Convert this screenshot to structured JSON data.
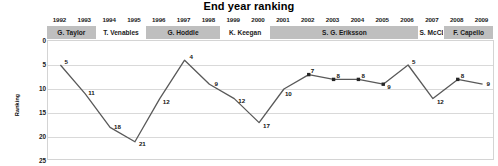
{
  "chart_data": {
    "type": "line",
    "title": "End year ranking",
    "xlabel": "",
    "ylabel": "Ranking",
    "ylim": [
      0,
      25
    ],
    "y_inverted": true,
    "y_ticks": [
      0,
      5,
      10,
      15,
      20,
      25
    ],
    "grid": true,
    "legend": "none",
    "x": [
      "1992",
      "1993",
      "1994",
      "1995",
      "1996",
      "1997",
      "1998",
      "1999",
      "2000",
      "2001",
      "2002",
      "2003",
      "2004",
      "2005",
      "2006",
      "2007",
      "2008",
      "2009"
    ],
    "categories": [
      "1992",
      "1993",
      "1994",
      "1995",
      "1996",
      "1997",
      "1998",
      "1999",
      "2000",
      "2001",
      "2002",
      "2003",
      "2004",
      "2005",
      "2006",
      "2007",
      "2008",
      "2009"
    ],
    "values": [
      5,
      11,
      18,
      21,
      12,
      4,
      9,
      12,
      17,
      10,
      7,
      8,
      8,
      9,
      5,
      12,
      8,
      9
    ],
    "data_labels": [
      "5",
      "11",
      "18",
      "21",
      "12",
      "4",
      "9",
      "12",
      "17",
      "10",
      "7",
      "8",
      "8",
      "9",
      "5",
      "12",
      "8",
      "9"
    ],
    "annotations": [
      {
        "label": "G. Taylor",
        "start_year": "1992",
        "end_year": "1993",
        "style": "shade"
      },
      {
        "label": "T. Venables",
        "start_year": "1994",
        "end_year": "1995",
        "style": "light"
      },
      {
        "label": "G. Hoddle",
        "start_year": "1996",
        "end_year": "1998",
        "style": "shade"
      },
      {
        "label": "K. Keegan",
        "start_year": "1999",
        "end_year": "2000",
        "style": "light"
      },
      {
        "label": "S. G. Eriksson",
        "start_year": "2001",
        "end_year": "2006",
        "style": "shade"
      },
      {
        "label": "S. McCL.",
        "start_year": "2007",
        "end_year": "2007",
        "style": "light"
      },
      {
        "label": "F. Capello",
        "start_year": "2008",
        "end_year": "2009",
        "style": "shade"
      }
    ],
    "series_color": "#595959",
    "marker_color": "#262626",
    "band_shade_color": "#bfbfbf",
    "grid_color": "#d9d9d9"
  }
}
